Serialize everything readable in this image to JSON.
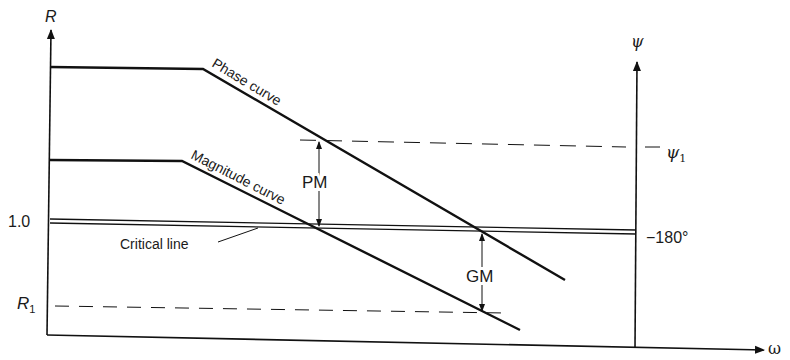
{
  "diagram": {
    "type": "Bode-style stability margin diagram (magnitude and phase vs frequency)",
    "left_axis": {
      "label": "R",
      "ticks": [
        {
          "label": "1.0"
        },
        {
          "label": "R",
          "subscript": "1"
        }
      ]
    },
    "right_axis": {
      "label": "ψ",
      "ticks": [
        {
          "label": "ψ",
          "subscript": "1",
          "prefix": "−"
        },
        {
          "label": "−180°"
        }
      ]
    },
    "x_axis": {
      "label": "ω"
    },
    "curves": {
      "phase": {
        "label": "Phase curve"
      },
      "magnitude": {
        "label": "Magnitude curve"
      },
      "critical": {
        "label": "Critical line"
      }
    },
    "margins": {
      "phase_margin": {
        "label": "PM"
      },
      "gain_margin": {
        "label": "GM"
      }
    }
  },
  "text": {
    "R": "R",
    "psi": "ψ",
    "omega": "ω",
    "one": "1.0",
    "R1_main": "R",
    "R1_sub": "1",
    "psi1_dash": "−",
    "psi1_main": "ψ",
    "psi1_sub": "1",
    "m180": "−180°",
    "phase_curve": "Phase curve",
    "magnitude_curve": "Magnitude curve",
    "critical_line": "Critical line",
    "PM": "PM",
    "GM": "GM"
  }
}
